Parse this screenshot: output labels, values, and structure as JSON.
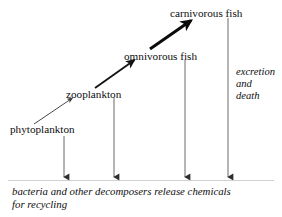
{
  "diagram": {
    "title_text": "",
    "nodes": [
      {
        "id": "phytoplankton",
        "label": "phytoplankton",
        "x": 10,
        "y": 123,
        "level": 1
      },
      {
        "id": "zooplankton",
        "label": "zooplankton",
        "x": 66,
        "y": 88,
        "level": 2
      },
      {
        "id": "omnivorous-fish",
        "label": "omnivorous fish",
        "x": 124,
        "y": 50,
        "level": 3
      },
      {
        "id": "carnivorous-fish",
        "label": "carnivorous fish",
        "x": 170,
        "y": 7,
        "level": 4
      }
    ],
    "side_note": {
      "lines": [
        "excretion",
        "and",
        "death"
      ],
      "x": 236,
      "y": 66
    },
    "bottom_note": {
      "lines": [
        "bacteria and other decomposers release chemicals",
        "for recycling"
      ],
      "x": 12,
      "y": 185
    },
    "feeding_arrows": [
      {
        "id": "phyto-to-zoo",
        "from": "phytoplankton",
        "to": "zooplankton",
        "x1": 34,
        "y1": 124,
        "x2": 74,
        "y2": 97,
        "width": 1.0
      },
      {
        "id": "zoo-to-omni",
        "from": "zooplankton",
        "to": "omnivorous-fish",
        "x1": 95,
        "y1": 88,
        "x2": 136,
        "y2": 59,
        "width": 1.9
      },
      {
        "id": "omni-to-carni",
        "from": "omnivorous-fish",
        "to": "carnivorous-fish",
        "x1": 150,
        "y1": 49,
        "x2": 193,
        "y2": 19,
        "width": 3.0
      }
    ],
    "decomposer_arrows": [
      {
        "id": "phyto-down",
        "from": "phytoplankton",
        "x": 64,
        "y1": 136,
        "y2": 178
      },
      {
        "id": "zoo-down",
        "from": "zooplankton",
        "x": 114,
        "y1": 98,
        "y2": 178
      },
      {
        "id": "omni-down",
        "from": "omnivorous-fish",
        "x": 185,
        "y1": 60,
        "y2": 178
      },
      {
        "id": "carni-down",
        "from": "carnivorous-fish",
        "x": 228,
        "y1": 18,
        "y2": 178
      }
    ],
    "divider": {
      "x1": 8,
      "x2": 274,
      "y": 180
    },
    "colors": {
      "ink": "#0d0d0d",
      "arrow_thin": "#4a4a4a",
      "arrow_thick": "#111111",
      "divider": "#b8b8b8",
      "background": "#ffffff"
    }
  }
}
